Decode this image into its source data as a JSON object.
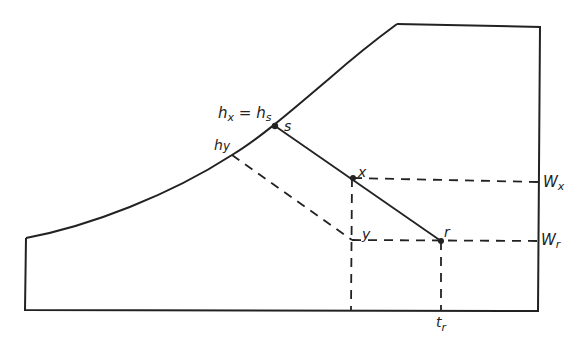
{
  "diagram": {
    "type": "psychrometric-style process diagram",
    "colors": {
      "line": "#222222",
      "background": "#ffffff"
    },
    "points": {
      "s": {
        "label": "s",
        "x": 275,
        "y": 126
      },
      "x": {
        "label": "x",
        "x": 353,
        "y": 178
      },
      "y": {
        "label": "y",
        "x": 352,
        "y": 240
      },
      "r": {
        "label": "r",
        "x": 441,
        "y": 241
      },
      "hy": {
        "x": 232,
        "y": 155
      }
    },
    "labels": {
      "hx_eq_hs": "hx = hs",
      "hx_main": "h",
      "hx_sub": "x",
      "eq": " = ",
      "hs_main": "h",
      "hs_sub": "s",
      "s": "s",
      "hy_main": "h",
      "hy_sub": "y",
      "x": "x",
      "y": "y",
      "r": "r",
      "Wx_main": "W",
      "Wx_sub": "x",
      "Wr_main": "W",
      "Wr_sub": "r",
      "tr_main": "t",
      "tr_sub": "r"
    }
  }
}
